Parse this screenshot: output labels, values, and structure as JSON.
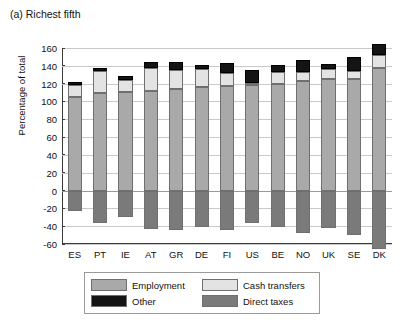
{
  "panel": {
    "title": "(a) Richest fifth"
  },
  "chart_data": {
    "type": "bar",
    "title": "(a) Richest fifth",
    "subtitle": "",
    "xlabel": "",
    "ylabel": "Percentage of total",
    "ylim": [
      -60,
      160
    ],
    "ytick_values": [
      160,
      140,
      120,
      100,
      80,
      60,
      40,
      20,
      0,
      -20,
      -40,
      -60
    ],
    "ytick_labels": [
      "160",
      "140",
      "120",
      "100",
      "80",
      "60",
      "40",
      "20",
      "0",
      "-20",
      "-40",
      "-60"
    ],
    "grid": true,
    "stacked": true,
    "legend_position": "bottom",
    "categories": [
      "ES",
      "PT",
      "IE",
      "AT",
      "GR",
      "DE",
      "FI",
      "US",
      "BE",
      "NO",
      "UK",
      "SE",
      "DK"
    ],
    "series": [
      {
        "name": "Employment",
        "color": "#a9a9a9",
        "values": [
          105,
          110,
          111,
          112,
          114,
          116,
          117,
          118,
          120,
          123,
          125,
          125,
          138
        ]
      },
      {
        "name": "Cash transfers",
        "color": "#e3e3e3",
        "values": [
          13,
          24,
          13,
          25,
          21,
          20,
          15,
          3,
          13,
          10,
          11,
          9,
          14
        ]
      },
      {
        "name": "Other",
        "color": "#141414",
        "values": [
          4,
          3,
          5,
          7,
          9,
          5,
          11,
          14,
          8,
          14,
          6,
          16,
          13
        ]
      },
      {
        "name": "Direct taxes",
        "color": "#7a7a7a",
        "values": [
          -23,
          -37,
          -30,
          -43,
          -44,
          -41,
          -44,
          -37,
          -41,
          -48,
          -42,
          -50,
          -66
        ]
      }
    ],
    "stack_tops": [
      122,
      137,
      129,
      144,
      144,
      141,
      143,
      135,
      141,
      147,
      142,
      150,
      165
    ]
  },
  "legend": {
    "items": [
      {
        "label": "Employment",
        "color": "#a9a9a9"
      },
      {
        "label": "Cash transfers",
        "color": "#e3e3e3"
      },
      {
        "label": "Other",
        "color": "#141414"
      },
      {
        "label": "Direct taxes",
        "color": "#7a7a7a"
      }
    ]
  }
}
